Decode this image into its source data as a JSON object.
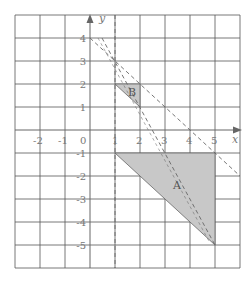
{
  "diagram": {
    "type": "coordinate-grid",
    "x_range": [
      -3,
      6
    ],
    "y_range": [
      -6,
      5
    ],
    "axis_labels": {
      "x": "x",
      "y": "y",
      "origin": "0"
    },
    "x_ticks": [
      "-2",
      "-1",
      "1",
      "2",
      "3",
      "4",
      "5"
    ],
    "y_ticks": [
      "4",
      "3",
      "2",
      "1",
      "-1",
      "-2",
      "-3",
      "-4",
      "-5"
    ],
    "shapes": [
      {
        "label": "B",
        "vertices": [
          [
            1,
            2
          ],
          [
            2,
            2
          ],
          [
            2,
            1
          ]
        ],
        "fill": "#c8c8c8"
      },
      {
        "label": "A",
        "vertices": [
          [
            1,
            -1
          ],
          [
            5,
            -1
          ],
          [
            5,
            -5
          ]
        ],
        "fill": "#c8c8c8"
      }
    ],
    "dashed_lines": [
      {
        "description": "vertical line x = 1",
        "from": [
          1,
          5
        ],
        "to": [
          1,
          -6
        ]
      },
      {
        "description": "line through (1,3), (2,1), (5,-5)",
        "from": [
          0.5,
          4
        ],
        "to": [
          5,
          -5
        ]
      },
      {
        "description": "line y = -x + 4",
        "from": [
          0,
          4
        ],
        "to": [
          6,
          -2
        ]
      }
    ],
    "colors": {
      "grid": "#555555",
      "shape_fill": "#c8c8c8",
      "text": "#777777"
    }
  }
}
